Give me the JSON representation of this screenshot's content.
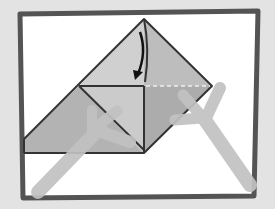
{
  "figure": {
    "colors": {
      "background": "#e3e3e3",
      "frame_border": "#545454",
      "frame_fill": "#ffffff",
      "paper_light": "#cdcdcd",
      "paper_mid": "#b9b9b9",
      "paper_dark": "#a9a9a9",
      "outline": "#333333",
      "hands": "#c2c2c2",
      "arrow": "#111111",
      "dashed_crease": "#eeeeee"
    },
    "annotations": {
      "fold_arrow": "fold-down",
      "crease": "valley-fold-dashed"
    }
  }
}
